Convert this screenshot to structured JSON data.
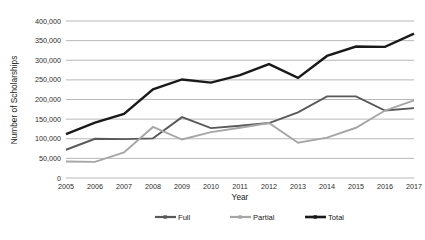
{
  "title_strip": "",
  "chart_data": {
    "type": "line",
    "title": "",
    "xlabel": "Year",
    "ylabel": "Number of Scholarships",
    "categories": [
      "2005",
      "2006",
      "2007",
      "2008",
      "2009",
      "2010",
      "2011",
      "2012",
      "2013",
      "2014",
      "2015",
      "2016",
      "2017"
    ],
    "x": [
      2005,
      2006,
      2007,
      2008,
      2009,
      2010,
      2011,
      2012,
      2013,
      2014,
      2015,
      2016,
      2017
    ],
    "ylim": [
      0,
      400000
    ],
    "xlim": [
      2005,
      2017
    ],
    "yticks": [
      0,
      50000,
      100000,
      150000,
      200000,
      250000,
      300000,
      350000,
      400000
    ],
    "ytick_labels": [
      "0",
      "50,000",
      "100,000",
      "150,000",
      "200,000",
      "250,000",
      "300,000",
      "350,000",
      "400,000"
    ],
    "grid": true,
    "legend_position": "bottom",
    "series": [
      {
        "name": "Full",
        "color": "#595959",
        "values": [
          72000,
          100000,
          99000,
          101000,
          155000,
          127000,
          133000,
          140000,
          167000,
          208000,
          208000,
          172000,
          178000
        ]
      },
      {
        "name": "Partial",
        "color": "#a6a6a6",
        "values": [
          42000,
          41000,
          65000,
          130000,
          98000,
          117000,
          128000,
          140000,
          90000,
          103000,
          128000,
          172000,
          198000
        ]
      },
      {
        "name": "Total",
        "color": "#1a1a1a",
        "values": [
          112000,
          141000,
          163000,
          226000,
          251000,
          243000,
          262000,
          290000,
          255000,
          311000,
          335000,
          334000,
          368000
        ]
      }
    ]
  },
  "legend": {
    "items": [
      {
        "label": "Full",
        "color": "#595959"
      },
      {
        "label": "Partial",
        "color": "#a6a6a6"
      },
      {
        "label": "Total",
        "color": "#1a1a1a"
      }
    ]
  }
}
